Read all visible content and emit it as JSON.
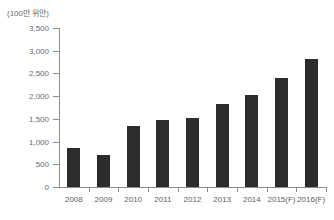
{
  "chart_data": {
    "type": "bar",
    "title": "",
    "subtitle": "",
    "xlabel": "",
    "ylabel": "(100만 위안)",
    "categories": [
      "2008",
      "2009",
      "2010",
      "2011",
      "2012",
      "2013",
      "2014",
      "2015(F)",
      "2016(F)"
    ],
    "values": [
      860,
      700,
      1340,
      1470,
      1520,
      1830,
      2030,
      2400,
      2820
    ],
    "series": [
      {
        "name": "",
        "values": [
          860,
          700,
          1340,
          1470,
          1520,
          1830,
          2030,
          2400,
          2820
        ]
      }
    ],
    "ylim": [
      0,
      3500
    ],
    "ytick_values": [
      0,
      500,
      1000,
      1500,
      2000,
      2500,
      3000,
      3500
    ],
    "ytick_labels": [
      "0",
      "500",
      "1,000",
      "1,500",
      "2,000",
      "2,500",
      "3,000",
      "3,500"
    ],
    "grid": false,
    "legend": null,
    "legend_position": "none",
    "bar_color": "#2c2c2c",
    "axis_color": "#8c8c8c",
    "tick_label_color": "#6a6a6a",
    "background_color": "#ffffff",
    "annotations": []
  }
}
